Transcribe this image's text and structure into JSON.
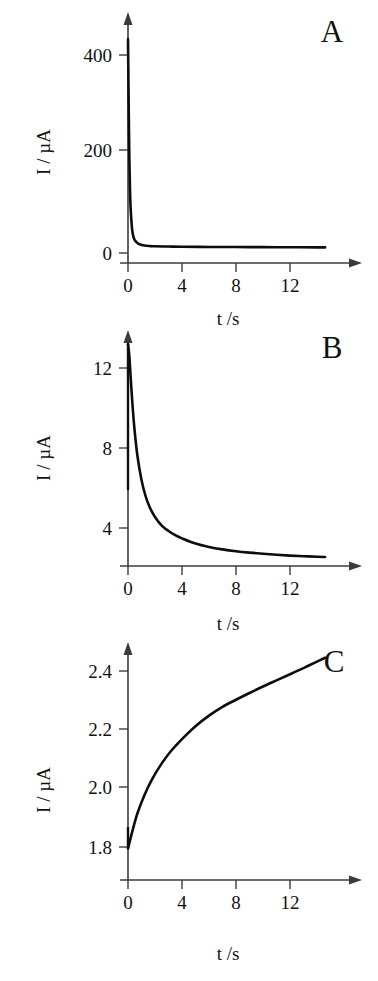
{
  "figure": {
    "background_color": "#ffffff",
    "curve_color": "#0d0d0d",
    "axis_color": "#3b3b3b"
  },
  "panels": [
    {
      "letter": "A",
      "xlabel": "t /s",
      "ylabel": "I / µA",
      "xticks": [
        "0",
        "4",
        "8",
        "12"
      ],
      "yticks": [
        "0",
        "200",
        "400"
      ]
    },
    {
      "letter": "B",
      "xlabel": "t /s",
      "ylabel": "I / µA",
      "xticks": [
        "0",
        "4",
        "8",
        "12"
      ],
      "yticks": [
        "4",
        "8",
        "12"
      ]
    },
    {
      "letter": "C",
      "xlabel": "t /s",
      "ylabel": "I / µA",
      "xticks": [
        "0",
        "4",
        "8",
        "12"
      ],
      "yticks": [
        "1.8",
        "2.0",
        "2.2",
        "2.4"
      ]
    }
  ],
  "chart_data": [
    {
      "id": "panel-a",
      "type": "line",
      "title": "A",
      "xlabel": "t /s",
      "ylabel": "I / µA",
      "xlim": [
        0,
        15
      ],
      "ylim": [
        0,
        470
      ],
      "xticks": [
        0,
        4,
        8,
        12
      ],
      "yticks": [
        0,
        200,
        400
      ],
      "grid": false,
      "legend": false,
      "series": [
        {
          "name": "current decay",
          "x": [
            0.0,
            0.02,
            0.05,
            0.1,
            0.15,
            0.2,
            0.3,
            0.4,
            0.5,
            0.7,
            0.9,
            1.2,
            1.6,
            2.0,
            3.0,
            4.0,
            6.0,
            8.0,
            10.0,
            12.0,
            14.0,
            14.6
          ],
          "y": [
            432,
            380,
            300,
            190,
            125,
            88,
            49,
            33,
            26,
            20,
            17,
            15,
            14,
            13.5,
            13,
            12.6,
            12.2,
            12.0,
            11.8,
            11.6,
            11.4,
            11.3
          ]
        }
      ]
    },
    {
      "id": "panel-b",
      "type": "line",
      "title": "B",
      "xlabel": "t /s",
      "ylabel": "I / µA",
      "xlim": [
        0,
        15
      ],
      "ylim": [
        1.4,
        14.2
      ],
      "xticks": [
        0,
        4,
        8,
        12
      ],
      "yticks": [
        4,
        8,
        12
      ],
      "grid": false,
      "legend": false,
      "series": [
        {
          "name": "current decay",
          "x": [
            0.0,
            0.1,
            0.2,
            0.35,
            0.5,
            0.7,
            1.0,
            1.3,
            1.6,
            2.0,
            2.5,
            3.0,
            3.5,
            4.0,
            5.0,
            6.0,
            7.0,
            8.0,
            9.0,
            10.0,
            11.0,
            12.0,
            13.0,
            14.0,
            14.6
          ],
          "y": [
            13.2,
            12.6,
            11.5,
            10.0,
            8.8,
            7.6,
            6.4,
            5.6,
            5.05,
            4.55,
            4.12,
            3.85,
            3.64,
            3.48,
            3.22,
            3.05,
            2.93,
            2.84,
            2.77,
            2.71,
            2.66,
            2.62,
            2.59,
            2.56,
            2.55
          ]
        }
      ],
      "initial_spike": {
        "x": 0.0,
        "y_from": 13.2,
        "y_to": 5.9
      }
    },
    {
      "id": "panel-c",
      "type": "line",
      "title": "C",
      "xlabel": "t /s",
      "ylabel": "I / µA",
      "xlim": [
        0,
        15
      ],
      "ylim": [
        1.68,
        2.52
      ],
      "xticks": [
        0,
        4,
        8,
        12
      ],
      "yticks": [
        1.8,
        2.0,
        2.2,
        2.4
      ],
      "grid": false,
      "legend": false,
      "series": [
        {
          "name": "current rise",
          "x": [
            0.0,
            0.3,
            0.7,
            1.2,
            1.8,
            2.5,
            3.2,
            4.0,
            5.0,
            6.0,
            7.0,
            8.0,
            9.0,
            10.0,
            11.0,
            12.0,
            13.0,
            14.0,
            14.6
          ],
          "y": [
            1.795,
            1.85,
            1.915,
            1.975,
            2.032,
            2.085,
            2.128,
            2.168,
            2.212,
            2.248,
            2.278,
            2.302,
            2.325,
            2.347,
            2.368,
            2.389,
            2.41,
            2.432,
            2.445
          ]
        }
      ],
      "initial_spike": {
        "x": 0.0,
        "y_from": 1.868,
        "y_to": 1.795
      }
    }
  ]
}
